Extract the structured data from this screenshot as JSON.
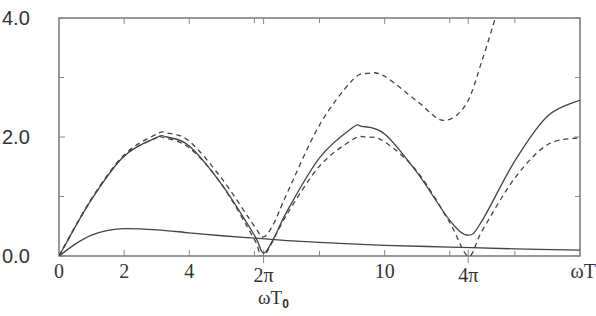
{
  "chart_data": {
    "type": "line",
    "title": "",
    "xlabel": "ωT₀",
    "x_end_label": "ωT",
    "ylabel": "",
    "xlim": [
      0,
      16
    ],
    "ylim": [
      0,
      4.0
    ],
    "grid": false,
    "legend": null,
    "y_ticks": [
      {
        "value": 0.0,
        "label": "0.0"
      },
      {
        "value": 2.0,
        "label": "2.0"
      },
      {
        "value": 4.0,
        "label": "4.0"
      }
    ],
    "y_minor_ticks": [
      1.0,
      3.0
    ],
    "x_ticks": [
      {
        "value": 0,
        "label": "0"
      },
      {
        "value": 2,
        "label": "2"
      },
      {
        "value": 4,
        "label": "4"
      },
      {
        "value": 6.2832,
        "label": "2π"
      },
      {
        "value": 10,
        "label": "10"
      },
      {
        "value": 12.5664,
        "label": "4π"
      },
      {
        "value": 16,
        "label": "ωT"
      }
    ],
    "x_minor_ticks": [
      6,
      8,
      12,
      14
    ],
    "series": [
      {
        "name": "solid-oscillating",
        "style": "solid",
        "x": [
          0,
          1,
          2,
          3,
          3.3,
          4,
          5,
          6,
          6.28,
          6.6,
          7,
          8,
          9,
          9.3,
          10,
          11,
          12,
          12.57,
          13,
          14,
          15,
          16
        ],
        "y": [
          0,
          0.95,
          1.68,
          1.99,
          2.0,
          1.85,
          1.2,
          0.35,
          0.05,
          0.3,
          0.75,
          1.65,
          2.15,
          2.18,
          2.05,
          1.4,
          0.6,
          0.35,
          0.6,
          1.6,
          2.35,
          2.62
        ]
      },
      {
        "name": "dashed-growing",
        "style": "dashed",
        "x": [
          0,
          1,
          2,
          3,
          3.3,
          4,
          5,
          6,
          6.28,
          6.6,
          7,
          8,
          9,
          9.5,
          10,
          11,
          11.8,
          12.5,
          13,
          13.4
        ],
        "y": [
          0,
          0.96,
          1.7,
          2.05,
          2.07,
          1.93,
          1.3,
          0.5,
          0.32,
          0.55,
          1.05,
          2.2,
          2.95,
          3.07,
          3.02,
          2.6,
          2.28,
          2.55,
          3.3,
          4.0
        ]
      },
      {
        "name": "dashed-periodic",
        "style": "dashed",
        "x": [
          0,
          1,
          2,
          3,
          3.14,
          4,
          5,
          6,
          6.28,
          7,
          8,
          9,
          9.42,
          10,
          11,
          12,
          12.57,
          13,
          14,
          15,
          16
        ],
        "y": [
          0,
          0.96,
          1.68,
          1.99,
          2.0,
          1.82,
          1.2,
          0.28,
          0.0,
          0.7,
          1.51,
          1.95,
          2.0,
          1.92,
          1.42,
          0.56,
          0.0,
          0.43,
          1.31,
          1.87,
          1.99
        ]
      },
      {
        "name": "solid-lower",
        "style": "solid",
        "x": [
          0,
          0.5,
          1,
          1.5,
          2,
          3,
          4,
          5,
          6,
          7,
          8,
          10,
          12,
          14,
          16
        ],
        "y": [
          0,
          0.2,
          0.35,
          0.43,
          0.46,
          0.44,
          0.39,
          0.34,
          0.3,
          0.26,
          0.23,
          0.18,
          0.15,
          0.12,
          0.1
        ]
      }
    ]
  }
}
